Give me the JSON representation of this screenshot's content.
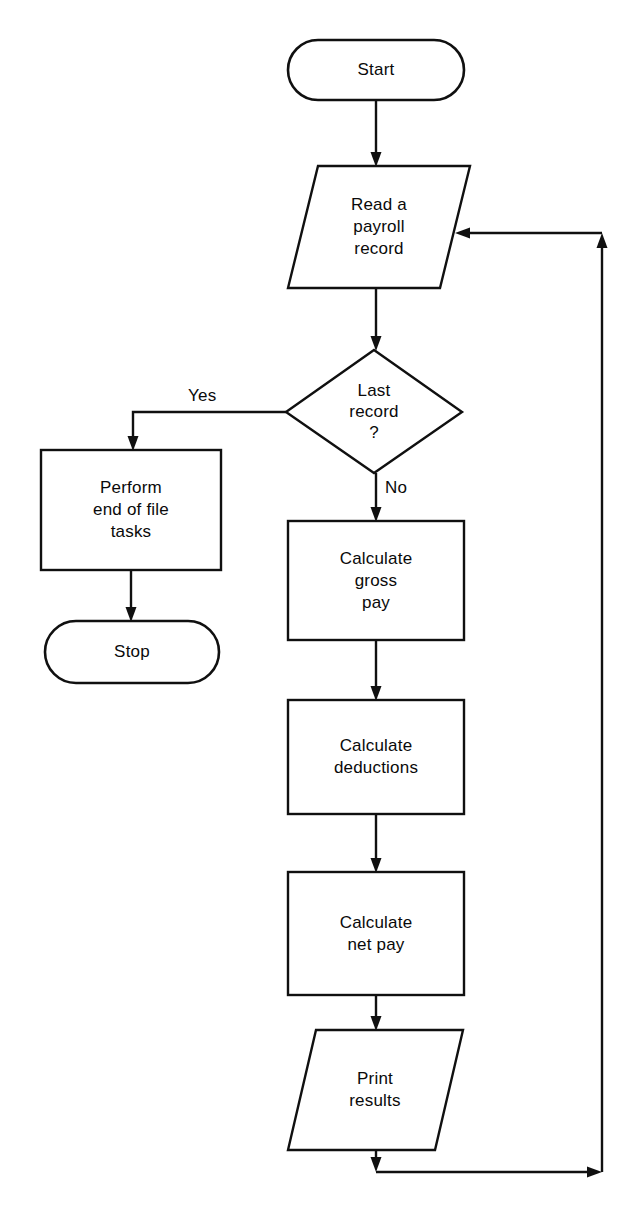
{
  "diagram": {
    "type": "flowchart",
    "background_color": "#ffffff",
    "line_color": "#101010",
    "text_color": "#0a0a0a",
    "nodes": [
      {
        "id": "start",
        "shape": "terminator",
        "label": "Start",
        "x": 288,
        "y": 40,
        "w": 176,
        "h": 60
      },
      {
        "id": "read-record",
        "shape": "parallelogram",
        "label": "Read a\npayroll\nrecord",
        "x": 288,
        "y": 166,
        "w": 182,
        "h": 122
      },
      {
        "id": "last-record",
        "shape": "diamond",
        "label": "Last\nrecord\n?",
        "x": 286,
        "y": 350,
        "w": 176,
        "h": 123
      },
      {
        "id": "eof-tasks",
        "shape": "process",
        "label": "Perform\nend of file\ntasks",
        "x": 41,
        "y": 450,
        "w": 180,
        "h": 120
      },
      {
        "id": "stop",
        "shape": "terminator",
        "label": "Stop",
        "x": 45,
        "y": 621,
        "w": 174,
        "h": 62
      },
      {
        "id": "gross-pay",
        "shape": "process",
        "label": "Calculate\ngross\npay",
        "x": 288,
        "y": 521,
        "w": 176,
        "h": 119
      },
      {
        "id": "deductions",
        "shape": "process",
        "label": "Calculate\ndeductions",
        "x": 288,
        "y": 700,
        "w": 176,
        "h": 114
      },
      {
        "id": "net-pay",
        "shape": "process",
        "label": "Calculate\nnet pay",
        "x": 288,
        "y": 872,
        "w": 176,
        "h": 123
      },
      {
        "id": "print-results",
        "shape": "parallelogram",
        "label": "Print\nresults",
        "x": 288,
        "y": 1030,
        "w": 175,
        "h": 120
      }
    ],
    "edges": [
      {
        "id": "start-to-read",
        "from": "start",
        "to": "read-record",
        "label": ""
      },
      {
        "id": "read-to-decision",
        "from": "read-record",
        "to": "last-record",
        "label": ""
      },
      {
        "id": "decision-yes",
        "from": "last-record",
        "to": "eof-tasks",
        "label": "Yes"
      },
      {
        "id": "decision-no",
        "from": "last-record",
        "to": "gross-pay",
        "label": "No"
      },
      {
        "id": "eof-to-stop",
        "from": "eof-tasks",
        "to": "stop",
        "label": ""
      },
      {
        "id": "gross-to-deductions",
        "from": "gross-pay",
        "to": "deductions",
        "label": ""
      },
      {
        "id": "deductions-to-net",
        "from": "deductions",
        "to": "net-pay",
        "label": ""
      },
      {
        "id": "net-to-print",
        "from": "net-pay",
        "to": "print-results",
        "label": ""
      },
      {
        "id": "print-loop-back",
        "from": "print-results",
        "to": "read-record",
        "label": ""
      }
    ],
    "edge_labels": {
      "yes": "Yes",
      "no": "No"
    }
  }
}
